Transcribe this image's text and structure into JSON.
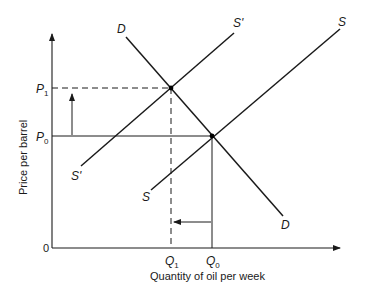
{
  "diagram": {
    "axes": {
      "x_label": "Quantity of oil per week",
      "y_label": "Price per barrel",
      "origin_label": "0"
    },
    "price_levels": [
      {
        "id": "P1",
        "main": "P",
        "sub": "1"
      },
      {
        "id": "P0",
        "main": "P",
        "sub": "0"
      }
    ],
    "quantity_levels": [
      {
        "id": "Q1",
        "main": "Q",
        "sub": "1"
      },
      {
        "id": "Q0",
        "main": "Q",
        "sub": "0"
      }
    ],
    "curves": {
      "demand": {
        "label_top": "D",
        "label_bottom": "D"
      },
      "supply_original": {
        "label_top": "S",
        "label_bottom": "S"
      },
      "supply_shifted": {
        "label_top": "S'",
        "label_bottom": "S'"
      }
    },
    "equilibria": [
      {
        "name": "new",
        "price": "P1",
        "quantity": "Q1"
      },
      {
        "name": "original",
        "price": "P0",
        "quantity": "Q0"
      }
    ],
    "arrows": [
      {
        "name": "price-increase",
        "direction": "up",
        "from": "P0",
        "to": "P1"
      },
      {
        "name": "quantity-decrease",
        "direction": "left",
        "from": "Q0",
        "to": "Q1"
      }
    ],
    "colors": {
      "ink": "#1a1a1a",
      "background": "#ffffff"
    }
  }
}
